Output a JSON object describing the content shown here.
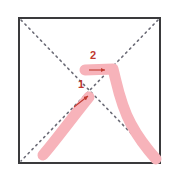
{
  "diagram": {
    "kind": "kanji-stroke-order",
    "stroke_count": 2,
    "background_color": "#ffffff",
    "frame": {
      "name": "practice-box",
      "x": 19,
      "y": 18,
      "width": 141,
      "height": 145,
      "border_color": "#3a3a3c",
      "border_width": 2,
      "fill": "#ffffff"
    },
    "guides": {
      "name": "diagonal-guide-lines",
      "style": "dotted",
      "color": "#6b6b76",
      "dot_size": 1.6,
      "lines": [
        {
          "name": "guide-tl-br",
          "x1": 21,
          "y1": 20,
          "x2": 158,
          "y2": 161
        },
        {
          "name": "guide-tr-bl",
          "x1": 158,
          "y1": 20,
          "x2": 21,
          "y2": 161
        }
      ]
    },
    "strokes": [
      {
        "number": "1",
        "name": "stroke-1-rising-diagonal",
        "color": "#f7b3ba",
        "width": 11,
        "path": "M 43 155 C 56 140, 72 118, 89 97",
        "start": {
          "x": 43,
          "y": 155
        },
        "end": {
          "x": 89,
          "y": 97
        },
        "direction": "lower-left to upper-right",
        "label": {
          "text": "1",
          "x": 81,
          "y": 88,
          "color": "#c0392f",
          "font_size": 11,
          "font_weight": "bold"
        },
        "arrow": {
          "name": "stroke-1-direction-arrow",
          "color": "#c0392f",
          "x1": 74,
          "y1": 107,
          "x2": 88,
          "y2": 96
        }
      },
      {
        "number": "2",
        "name": "stroke-2-horizontal-then-sweep",
        "color": "#f7b3ba",
        "width": 11,
        "path": "M 85 70 L 113 69 C 117 84, 120 104, 131 124 C 139 139, 148 150, 156 159",
        "start": {
          "x": 85,
          "y": 70
        },
        "end": {
          "x": 156,
          "y": 159
        },
        "direction": "left to right, then curving down to lower-right",
        "label": {
          "text": "2",
          "x": 93,
          "y": 59,
          "color": "#c0392f",
          "font_size": 11,
          "font_weight": "bold"
        },
        "arrow": {
          "name": "stroke-2-direction-arrow",
          "color": "#c0392f",
          "x1": 89,
          "y1": 70,
          "x2": 105,
          "y2": 70
        }
      }
    ]
  }
}
